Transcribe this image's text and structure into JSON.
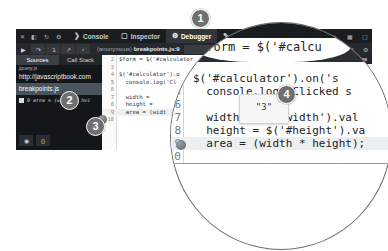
{
  "tabbar": {
    "left_icons": [
      "close-icon",
      "dock-icon",
      "refresh-icon",
      "gear-icon"
    ],
    "tabs": [
      {
        "id": "console",
        "label": "Console",
        "icon": "console-icon",
        "glyph": "❯"
      },
      {
        "id": "inspector",
        "label": "Inspector",
        "icon": "inspector-icon",
        "glyph": "▢"
      },
      {
        "id": "debugger",
        "label": "Debugger",
        "icon": "debugger-icon",
        "glyph": "⚙",
        "active": true
      },
      {
        "id": "style-editor",
        "label": "Style Editor",
        "icon": "style-editor-icon",
        "glyph": "✎"
      }
    ],
    "right_icons": [
      "responsive-icon",
      "paintbrush-icon",
      "scratchpad-icon",
      "grid-icon",
      "dock-side-icon"
    ]
  },
  "toolbar": {
    "buttons": [
      "resume-icon",
      "step-over-icon",
      "step-in-icon",
      "step-out-icon",
      "back-icon"
    ],
    "breadcrumb_scope": "(anonymous)",
    "breadcrumb_file": "breakpoints.js:9",
    "right_icons": [
      "columns-icon",
      "settings-icon"
    ]
  },
  "sidebar": {
    "tabs": [
      {
        "label": "Sources",
        "active": true
      },
      {
        "label": "Call Stack",
        "active": false
      }
    ],
    "sources": {
      "partial_item": "jquery.js",
      "url": "http://javascriptbook.com",
      "selected_file": "breakpoints.js"
    },
    "breakpoint": {
      "line": "9",
      "code": "area = (width * hei"
    },
    "bottom_buttons": [
      "eye-icon",
      "pretty-print-icon"
    ]
  },
  "editor": {
    "lines": [
      {
        "n": "2",
        "code": "$form = $('#calculator"
      },
      {
        "n": "3",
        "code": ""
      },
      {
        "n": "4",
        "code": "$('#calculator').o"
      },
      {
        "n": "5",
        "code": "  console.log('Cl"
      },
      {
        "n": "6",
        "code": ""
      },
      {
        "n": "7",
        "code": "  width ="
      },
      {
        "n": "8",
        "code": "  height ="
      },
      {
        "n": "9",
        "code": "  area = (widt",
        "highlight": true
      },
      {
        "n": "10",
        "code": ""
      }
    ],
    "tooltip_value": "\"3\""
  },
  "variables": {
    "header": "Variables",
    "input_placeholder": "Add watch",
    "function_header": "Function scope",
    "items": [
      "this:",
      "Ob",
      "pu"
    ]
  },
  "magnifier": {
    "first_line": "$form = $('#calcu",
    "lines": [
      {
        "n": "4",
        "code": "$('#calculator').on('s"
      },
      {
        "n": "5",
        "code": "  console.log('Clicked s"
      },
      {
        "n": "6",
        "code": ""
      },
      {
        "n": "7",
        "code": "  width = $('#width').val"
      },
      {
        "n": "8",
        "code": "  height = $('#height').va"
      },
      {
        "n": "9",
        "code": "  area = (width * height);",
        "highlight": true
      },
      {
        "n": "10",
        "code": ""
      }
    ],
    "tooltip_value": "\"3\""
  },
  "callouts": [
    "1",
    "2",
    "3",
    "4"
  ],
  "colors": {
    "devtools_bg": "#14171a",
    "active_tab": "#323539",
    "selected_source": "#49545f",
    "callout": "#6f6f6f"
  }
}
